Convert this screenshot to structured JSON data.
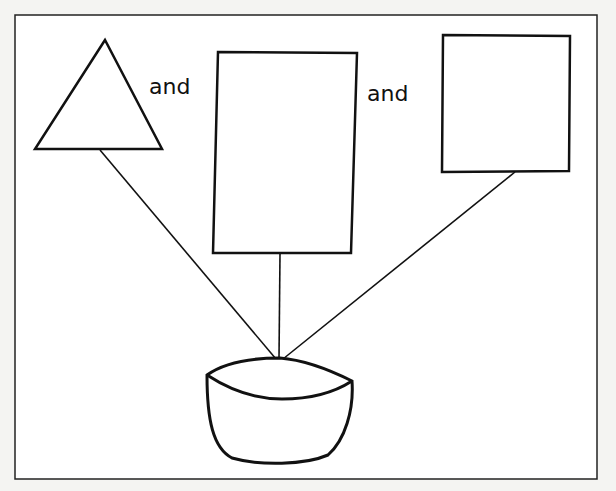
{
  "diagram": {
    "labels": {
      "first_connector": "and",
      "second_connector": "and"
    },
    "shapes": [
      {
        "id": "triangle",
        "kind": "triangle"
      },
      {
        "id": "tall-rectangle",
        "kind": "rectangle"
      },
      {
        "id": "square",
        "kind": "square"
      },
      {
        "id": "bowl",
        "kind": "bowl"
      }
    ],
    "connections": [
      {
        "from": "triangle",
        "to": "bowl"
      },
      {
        "from": "tall-rectangle",
        "to": "bowl"
      },
      {
        "from": "square",
        "to": "bowl"
      }
    ],
    "colors": {
      "stroke": "#111111",
      "background": "#ffffff"
    }
  }
}
